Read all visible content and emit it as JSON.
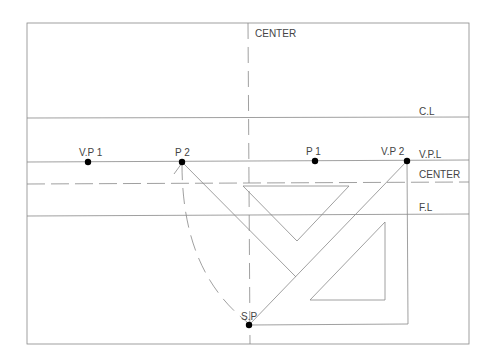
{
  "diagram": {
    "type": "two-point perspective construction",
    "labels": {
      "center_top": "CENTER",
      "cl": "C.L",
      "vpl": "V.P.L",
      "center_right": "CENTER",
      "fl": "F.L",
      "vp1": "V.P 1",
      "p2": "P 2",
      "p1": "P 1",
      "vp2": "V.P 2",
      "sp": "S.P"
    },
    "frame": {
      "x1": 27,
      "y1": 23,
      "x2": 469,
      "y2": 344
    },
    "lines": {
      "center_vertical_x": 249,
      "cl_y": 118,
      "vpl_y": 162,
      "center_horizontal_y": 183,
      "fl_y": 216
    },
    "points": [
      {
        "name": "V.P 1",
        "x": 88,
        "y": 162
      },
      {
        "name": "P 2",
        "x": 182,
        "y": 162
      },
      {
        "name": "P 1",
        "x": 315,
        "y": 161
      },
      {
        "name": "V.P 2",
        "x": 407,
        "y": 161
      },
      {
        "name": "S.P",
        "x": 249,
        "y": 325
      }
    ],
    "colors": {
      "line": "#888888",
      "point": "#000000",
      "text": "#444444"
    }
  }
}
